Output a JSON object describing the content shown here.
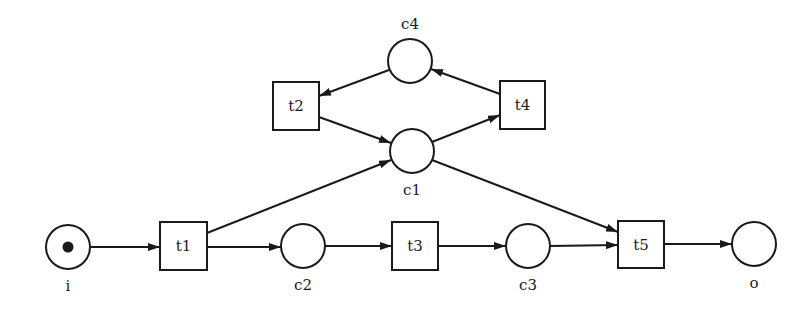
{
  "diagram": {
    "type": "petri-net",
    "places": [
      {
        "id": "i",
        "label": "i",
        "x": 68,
        "y": 247,
        "r": 22,
        "tokens": 1,
        "label_pos": "below"
      },
      {
        "id": "c2",
        "label": "c2",
        "x": 303,
        "y": 246,
        "r": 22,
        "tokens": 0,
        "label_pos": "below"
      },
      {
        "id": "c3",
        "label": "c3",
        "x": 528,
        "y": 246,
        "r": 22,
        "tokens": 0,
        "label_pos": "below"
      },
      {
        "id": "o",
        "label": "o",
        "x": 754,
        "y": 244,
        "r": 22,
        "tokens": 0,
        "label_pos": "below"
      },
      {
        "id": "c1",
        "label": "c1",
        "x": 412,
        "y": 151,
        "r": 22,
        "tokens": 0,
        "label_pos": "below"
      },
      {
        "id": "c4",
        "label": "c4",
        "x": 410,
        "y": 61,
        "r": 22,
        "tokens": 0,
        "label_pos": "above"
      }
    ],
    "transitions": [
      {
        "id": "t1",
        "label": "t1",
        "x": 160,
        "y": 222,
        "w": 47,
        "h": 48
      },
      {
        "id": "t2",
        "label": "t2",
        "x": 273,
        "y": 82,
        "w": 46,
        "h": 48
      },
      {
        "id": "t3",
        "label": "t3",
        "x": 392,
        "y": 222,
        "w": 46,
        "h": 48
      },
      {
        "id": "t4",
        "label": "t4",
        "x": 500,
        "y": 81,
        "w": 45,
        "h": 48
      },
      {
        "id": "t5",
        "label": "t5",
        "x": 618,
        "y": 221,
        "w": 46,
        "h": 47
      }
    ],
    "arcs": [
      {
        "from": "i",
        "to": "t1",
        "x1": 90,
        "y1": 247,
        "x2": 160,
        "y2": 247
      },
      {
        "from": "t1",
        "to": "c2",
        "x1": 207,
        "y1": 247,
        "x2": 281,
        "y2": 247
      },
      {
        "from": "t1",
        "to": "c1",
        "x1": 207,
        "y1": 233,
        "x2": 391,
        "y2": 160
      },
      {
        "from": "c2",
        "to": "t3",
        "x1": 325,
        "y1": 246,
        "x2": 392,
        "y2": 246
      },
      {
        "from": "t3",
        "to": "c3",
        "x1": 438,
        "y1": 246,
        "x2": 506,
        "y2": 246
      },
      {
        "from": "c3",
        "to": "t5",
        "x1": 550,
        "y1": 246,
        "x2": 618,
        "y2": 245
      },
      {
        "from": "c1",
        "to": "t5",
        "x1": 432,
        "y1": 160,
        "x2": 618,
        "y2": 232
      },
      {
        "from": "t5",
        "to": "o",
        "x1": 664,
        "y1": 244,
        "x2": 732,
        "y2": 244
      },
      {
        "from": "c1",
        "to": "t4",
        "x1": 432,
        "y1": 142,
        "x2": 500,
        "y2": 115
      },
      {
        "from": "t4",
        "to": "c4",
        "x1": 500,
        "y1": 94,
        "x2": 431,
        "y2": 69
      },
      {
        "from": "c4",
        "to": "t2",
        "x1": 389,
        "y1": 70,
        "x2": 319,
        "y2": 96
      },
      {
        "from": "t2",
        "to": "c1",
        "x1": 319,
        "y1": 117,
        "x2": 391,
        "y2": 143
      }
    ]
  }
}
